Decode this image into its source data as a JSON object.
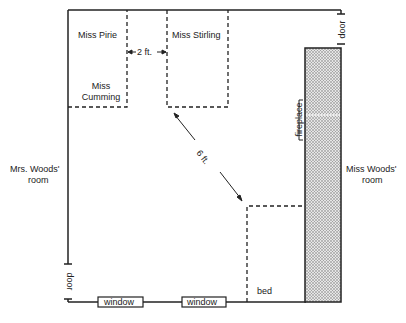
{
  "diagram": {
    "labels": {
      "miss_pirie": "Miss Pirie",
      "miss_stirling": "Miss Stirling",
      "miss_cumming_1": "Miss",
      "miss_cumming_2": "Cumming",
      "gap": "2 ft.",
      "distance": "6 ft.",
      "mrs_woods_1": "Mrs. Woods'",
      "mrs_woods_2": "room",
      "miss_woods_1": "Miss Woods'",
      "miss_woods_2": "room",
      "fireplace": "fireplace",
      "door_top": "door",
      "door_left": "door",
      "window_1": "window",
      "window_2": "window",
      "bed": "bed"
    },
    "colors": {
      "line": "#222222",
      "fireplace_fill": "#bbbbbb"
    }
  }
}
